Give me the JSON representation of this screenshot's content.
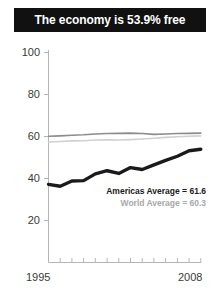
{
  "title": {
    "text": "The economy is 53.9% free"
  },
  "annotations": {
    "americas": "Americas Average = 61.6",
    "world": "World Average = 60.3"
  },
  "axis": {
    "y_ticks": [
      "100",
      "80",
      "60",
      "40",
      "20"
    ],
    "x_first": "1995",
    "x_last": "2008"
  },
  "colors": {
    "banner_bg": "#111111",
    "banner_text": "#ffffff",
    "series_main": "#1a1a1a",
    "series_americas": "#8c8c8c",
    "series_world": "#d0d0d0",
    "axis": "#b5b5b5",
    "tick_text": "#3a3a3a"
  },
  "chart_data": {
    "type": "line",
    "title": "The economy is 53.9% free",
    "xlabel": "",
    "ylabel": "",
    "xlim": [
      1995,
      2008
    ],
    "ylim": [
      10,
      100
    ],
    "grid": false,
    "legend_position": "inline-annotation",
    "x": [
      1995,
      1996,
      1997,
      1998,
      1999,
      2000,
      2001,
      2002,
      2003,
      2004,
      2005,
      2006,
      2007,
      2008
    ],
    "series": [
      {
        "name": "Country score",
        "color": "#1a1a1a",
        "values": [
          37.2,
          36.3,
          38.8,
          39.0,
          42.2,
          43.7,
          42.4,
          45.2,
          44.3,
          46.5,
          48.6,
          50.6,
          53.2,
          53.9
        ]
      },
      {
        "name": "Americas Average",
        "color": "#8c8c8c",
        "values": [
          60.1,
          60.3,
          60.6,
          60.8,
          61.2,
          61.4,
          61.5,
          61.6,
          61.4,
          61.0,
          61.2,
          61.4,
          61.5,
          61.6
        ]
      },
      {
        "name": "World Average",
        "color": "#d0d0d0",
        "values": [
          57.4,
          57.6,
          57.9,
          58.0,
          58.3,
          58.4,
          58.3,
          58.5,
          58.8,
          59.2,
          59.6,
          59.9,
          60.1,
          60.3
        ]
      }
    ]
  }
}
